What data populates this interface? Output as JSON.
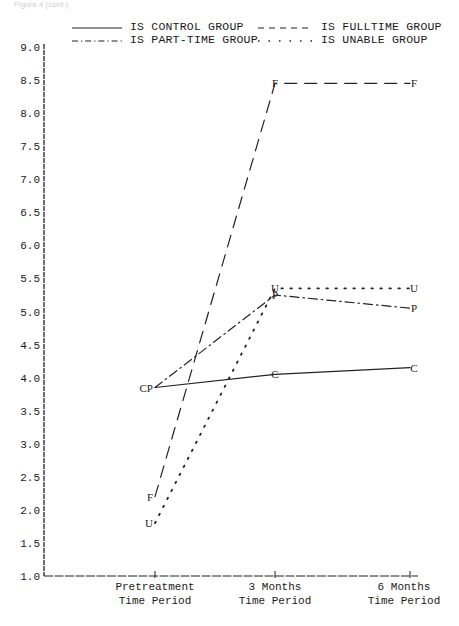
{
  "caption_fragment": "Figure 4 (cont.)",
  "chart_data": {
    "type": "line",
    "title": "",
    "xlabel": "",
    "ylabel": "",
    "categories": [
      "Pretreatment Time Period",
      "3 Months Time Period",
      "6 Months Time Period"
    ],
    "category_lines": [
      [
        "Pretreatment",
        "Time Period"
      ],
      [
        "3 Months",
        "Time Period"
      ],
      [
        "6 Months",
        "Time Period"
      ]
    ],
    "yticks": [
      "1.0",
      "1.5",
      "2.0",
      "2.5",
      "3.0",
      "3.5",
      "4.0",
      "4.5",
      "5.0",
      "5.5",
      "6.0",
      "6.5",
      "7.0",
      "7.5",
      "8.0",
      "8.5",
      "9.0"
    ],
    "ylim": [
      1.0,
      9.0
    ],
    "grid": false,
    "legend_position": "top",
    "series": [
      {
        "name": "IS CONTROL GROUP",
        "marker": "C",
        "style": "solid",
        "values": [
          3.85,
          4.05,
          4.15
        ]
      },
      {
        "name": "IS FULLTIME GROUP",
        "marker": "F",
        "style": "dashed",
        "values": [
          2.2,
          8.45,
          8.45
        ]
      },
      {
        "name": "IS PART-TIME GROUP",
        "marker": "P",
        "style": "dashdot",
        "values": [
          3.85,
          5.25,
          5.05
        ]
      },
      {
        "name": "IS UNABLE GROUP",
        "marker": "U",
        "style": "dotted",
        "values": [
          1.8,
          5.35,
          5.35
        ]
      }
    ],
    "annotations": [
      "CP label at pretreatment marks coincident Control and Part-time values"
    ]
  },
  "legend": {
    "control": "IS CONTROL GROUP",
    "fulltime": "IS FULLTIME GROUP",
    "parttime": "IS PART-TIME GROUP",
    "unable": "IS UNABLE GROUP"
  }
}
